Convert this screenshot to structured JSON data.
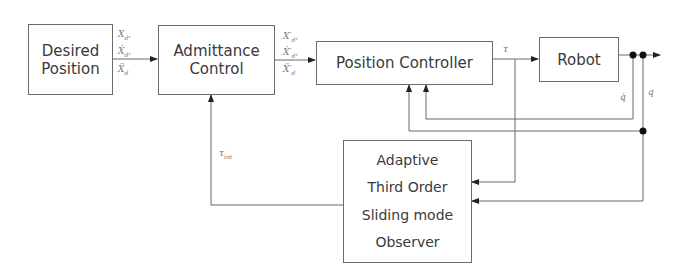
{
  "diagram": {
    "blocks": {
      "desired_position": {
        "lines": [
          "Desired",
          "Position"
        ]
      },
      "admittance_control": {
        "lines": [
          "Admittance",
          "Control"
        ]
      },
      "position_controller": {
        "lines": [
          "Position Controller"
        ]
      },
      "robot": {
        "lines": [
          "Robot"
        ]
      },
      "observer": {
        "lines": [
          "Adaptive",
          "Third Order",
          "Sliding mode",
          "Observer"
        ]
      }
    },
    "signals": {
      "desired_out": {
        "l1": "X",
        "l1_sub": "d",
        "l1_suffix": ",",
        "l2": "Ẋ",
        "l2_sub": "d",
        "l2_suffix": ",",
        "l3": "Ẍ",
        "l3_sub": "d"
      },
      "admittance_out": {
        "l1": "X′",
        "l1_sub": "d",
        "l1_suffix": ",",
        "l2": "Ẋ′",
        "l2_sub": "d",
        "l2_suffix": ",",
        "l3": "Ẍ′",
        "l3_sub": "d"
      },
      "tau": "τ",
      "q_inner": "q̇",
      "q_outer": "q",
      "tau_int": {
        "base": "τ",
        "sub": "int"
      }
    },
    "colors": {
      "line": "#6b6b6b",
      "text": "#3a3a3a",
      "label": "#777777",
      "node": "#111111"
    }
  }
}
